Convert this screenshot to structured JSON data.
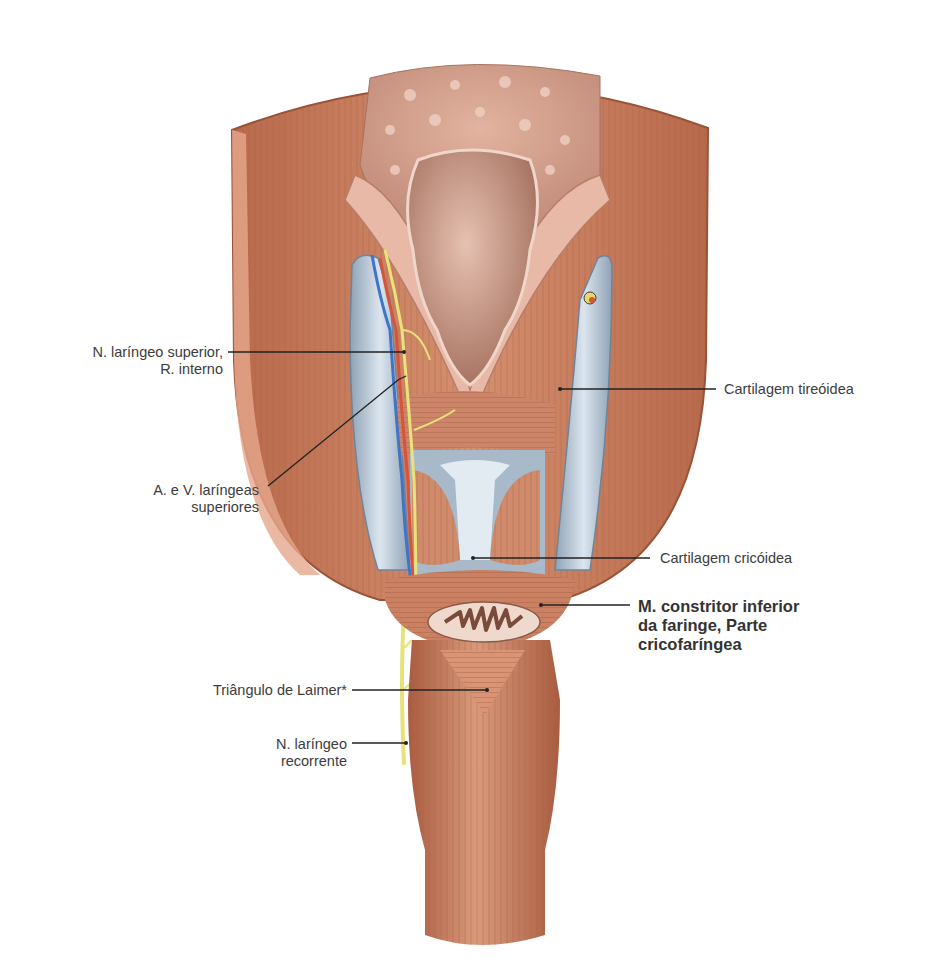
{
  "figure": {
    "colors": {
      "muscle": "#c98063",
      "muscle_dark": "#a85f43",
      "muscle_light": "#e3a58a",
      "mucosa": "#d9a28c",
      "cartilage": "#b9c7d4",
      "cartilage_dark": "#7f93a6",
      "nerve": "#e8e27a",
      "artery": "#d2553c",
      "vein": "#3f74c9",
      "leader": "#222222",
      "background": "#ffffff"
    }
  },
  "labels": {
    "n_laringeo_superior": {
      "line1": "N. laríngeo superior,",
      "line2": "R. interno"
    },
    "a_v_laringeas": {
      "line1": "A. e V. laríngeas",
      "line2": "superiores"
    },
    "cartilagem_tireoidea": {
      "text": "Cartilagem tireóidea"
    },
    "cartilagem_cricoidea": {
      "text": "Cartilagem cricóidea"
    },
    "m_constritor": {
      "line1": "M. constritor inferior",
      "line2": "da faringe, Parte",
      "line3": "cricofaríngea"
    },
    "triangulo_laimer": {
      "text": "Triângulo de Laimer*"
    },
    "n_laringeo_recorrente": {
      "line1": "N. laríngeo",
      "line2": "recorrente"
    }
  }
}
